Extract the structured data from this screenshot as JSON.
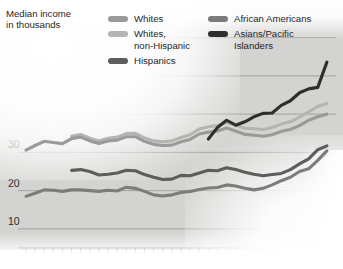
{
  "chart_data": {
    "type": "line",
    "title": "Median income\nin thousands",
    "xlabel": "",
    "ylabel": "Median income in thousands",
    "xlim": [
      1967,
      2001
    ],
    "ylim": [
      5,
      62
    ],
    "yticks": [
      10,
      20,
      30,
      40,
      50,
      60
    ],
    "xticks": [
      1967,
      1970,
      1980,
      1990,
      2000
    ],
    "xtick_labels": [
      "1967",
      "1970",
      "1980",
      "1990",
      "2000"
    ],
    "ytick_labels": [
      "10",
      "20",
      "30",
      "40",
      "50",
      "60"
    ],
    "minor_xticks_every": 1,
    "grid": "horizontal",
    "legend_position": "top",
    "series": [
      {
        "name": "Whites",
        "color": "#9a9a98",
        "x": [
          1967,
          1968,
          1969,
          1970,
          1971,
          1972,
          1973,
          1974,
          1975,
          1976,
          1977,
          1978,
          1979,
          1980,
          1981,
          1982,
          1983,
          1984,
          1985,
          1986,
          1987,
          1988,
          1989,
          1990,
          1991,
          1992,
          1993,
          1994,
          1995,
          1996,
          1997,
          1998,
          1999,
          2000
        ],
        "values": [
          30.6,
          31.8,
          32.9,
          32.6,
          32.3,
          33.6,
          34.0,
          33.0,
          32.3,
          33.0,
          33.2,
          34.1,
          34.1,
          32.9,
          32.1,
          31.8,
          31.9,
          32.8,
          33.4,
          34.8,
          35.3,
          35.6,
          36.4,
          35.6,
          34.7,
          34.5,
          34.2,
          34.6,
          35.5,
          36.0,
          37.0,
          38.4,
          39.3,
          40.0
        ]
      },
      {
        "name": "Whites, non-Hispanic",
        "color": "#b4b4b2",
        "x": [
          1972,
          1973,
          1974,
          1975,
          1976,
          1977,
          1978,
          1979,
          1980,
          1981,
          1982,
          1983,
          1984,
          1985,
          1986,
          1987,
          1988,
          1989,
          1990,
          1991,
          1992,
          1993,
          1994,
          1995,
          1996,
          1997,
          1998,
          1999,
          2000
        ],
        "values": [
          34.2,
          34.7,
          33.7,
          33.0,
          33.7,
          34.0,
          34.9,
          35.0,
          33.8,
          33.0,
          32.8,
          33.0,
          33.9,
          34.6,
          36.1,
          36.7,
          37.0,
          37.8,
          37.1,
          36.3,
          36.2,
          36.0,
          36.5,
          37.4,
          38.0,
          39.2,
          40.6,
          42.0,
          42.8
        ]
      },
      {
        "name": "Hispanics",
        "color": "#5d5d5b",
        "x": [
          1972,
          1973,
          1974,
          1975,
          1976,
          1977,
          1978,
          1979,
          1980,
          1981,
          1982,
          1983,
          1984,
          1985,
          1986,
          1987,
          1988,
          1989,
          1990,
          1991,
          1992,
          1993,
          1994,
          1995,
          1996,
          1997,
          1998,
          1999,
          2000
        ],
        "values": [
          25.3,
          25.5,
          25.0,
          24.1,
          24.3,
          24.6,
          25.3,
          25.2,
          24.2,
          23.5,
          22.9,
          23.0,
          24.0,
          23.9,
          24.6,
          25.3,
          25.2,
          26.0,
          25.5,
          24.8,
          24.3,
          23.9,
          24.2,
          24.5,
          25.5,
          27.0,
          28.3,
          30.7,
          31.7
        ]
      },
      {
        "name": "African Americans",
        "color": "#7c7c7a",
        "x": [
          1967,
          1968,
          1969,
          1970,
          1971,
          1972,
          1973,
          1974,
          1975,
          1976,
          1977,
          1978,
          1979,
          1980,
          1981,
          1982,
          1983,
          1984,
          1985,
          1986,
          1987,
          1988,
          1989,
          1990,
          1991,
          1992,
          1993,
          1994,
          1995,
          1996,
          1997,
          1998,
          1999,
          2000
        ],
        "values": [
          18.5,
          19.3,
          20.2,
          20.1,
          19.8,
          20.2,
          20.2,
          20.0,
          19.8,
          20.1,
          19.9,
          20.9,
          20.6,
          19.8,
          18.9,
          18.6,
          18.9,
          19.5,
          19.8,
          20.3,
          20.7,
          20.8,
          21.5,
          21.2,
          20.6,
          20.2,
          20.6,
          21.5,
          22.6,
          23.5,
          25.0,
          25.7,
          27.9,
          30.4
        ]
      },
      {
        "name": "Asians/Pacific Islanders",
        "color": "#2e2e2c",
        "x": [
          1987,
          1988,
          1989,
          1990,
          1991,
          1992,
          1993,
          1994,
          1995,
          1996,
          1997,
          1998,
          1999,
          2000
        ],
        "values": [
          33.5,
          36.5,
          38.4,
          37.1,
          38.0,
          39.3,
          40.2,
          40.3,
          42.3,
          43.5,
          45.6,
          46.6,
          47.0,
          53.6
        ]
      }
    ]
  },
  "legend": {
    "column1": [
      {
        "label": "Whites",
        "color": "#9a9a98"
      },
      {
        "label": "Whites,\nnon-Hispanic",
        "color": "#b4b4b2"
      },
      {
        "label": "Hispanics",
        "color": "#5d5d5b"
      }
    ],
    "column2": [
      {
        "label": "African Americans",
        "color": "#7c7c7a"
      },
      {
        "label": "Asians/Pacific\nIslanders",
        "color": "#2e2e2c"
      }
    ]
  },
  "colors": {
    "plot_background": "#d3d3d1",
    "gridline": "#9c9c9a",
    "axis": "#55554f",
    "text": "#262626"
  }
}
